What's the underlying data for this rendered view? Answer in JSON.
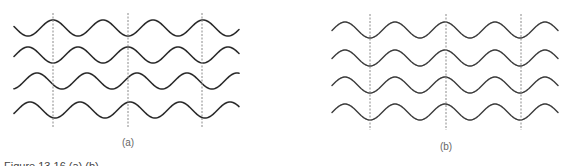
{
  "figure": {
    "stroke_color": "#2a2a2a",
    "guide_color": "#8a8a8a",
    "panels": [
      {
        "id": "a",
        "label": "(a)",
        "label_x": 128,
        "label_y": 137,
        "x_start": 14,
        "x_end": 239,
        "period": 50,
        "amplitude": 8,
        "waves": [
          {
            "center_y": 28,
            "peak_x": 53
          },
          {
            "center_y": 55,
            "peak_x": 28
          },
          {
            "center_y": 81,
            "peak_x": 37
          },
          {
            "center_y": 110,
            "peak_x": 30
          }
        ],
        "guides": [
          {
            "x": 53,
            "y1": 13,
            "y2": 127
          },
          {
            "x": 128,
            "y1": 13,
            "y2": 127
          },
          {
            "x": 202,
            "y1": 13,
            "y2": 127
          }
        ]
      },
      {
        "id": "b",
        "label": "(b)",
        "label_x": 446,
        "label_y": 141,
        "x_start": 332,
        "x_end": 558,
        "period": 50,
        "amplitude": 8,
        "waves": [
          {
            "center_y": 30,
            "peak_x": 345
          },
          {
            "center_y": 58,
            "peak_x": 345
          },
          {
            "center_y": 85,
            "peak_x": 345
          },
          {
            "center_y": 112,
            "peak_x": 345
          }
        ],
        "guides": [
          {
            "x": 370,
            "y1": 14,
            "y2": 130
          },
          {
            "x": 446,
            "y1": 14,
            "y2": 130
          },
          {
            "x": 521,
            "y1": 14,
            "y2": 130
          }
        ]
      }
    ],
    "caption": "Figure 13.16 (a) (b)"
  }
}
